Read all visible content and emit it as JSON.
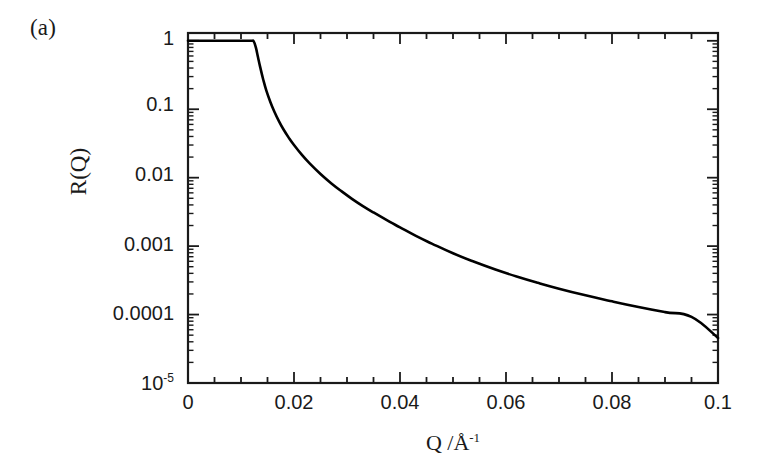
{
  "figure": {
    "panel_label": "(a)",
    "background_color": "#ffffff",
    "line_color": "#000000",
    "axis_color": "#1a1a1a"
  },
  "axes": {
    "y_title": "R(Q)",
    "x_title_main": "Q /",
    "x_title_unit": "Å",
    "x_title_exp": "-1",
    "x_title_full": "Q /Å-1"
  },
  "ticks": {
    "y_labels": [
      "1",
      "0.1",
      "0.01",
      "0.001",
      "0.0001",
      "10"
    ],
    "y_last_exponent": "-5",
    "x_labels": [
      "0",
      "0.02",
      "0.04",
      "0.06",
      "0.08",
      "0.1"
    ]
  },
  "chart_data": {
    "type": "line",
    "title": "",
    "subtitle": "",
    "xlabel": "Q /Å⁻¹",
    "ylabel": "R(Q)",
    "panel": "(a)",
    "xscale": "linear",
    "yscale": "log",
    "xlim": [
      0,
      0.1
    ],
    "ylim": [
      1e-05,
      1.3
    ],
    "grid": false,
    "legend": null,
    "x_major_ticks": [
      0,
      0.02,
      0.04,
      0.06,
      0.08,
      0.1
    ],
    "x_minor_tick_step": 0.005,
    "y_major_ticks": [
      1,
      0.1,
      0.01,
      0.001,
      0.0001,
      1e-05
    ],
    "y_tick_labels": [
      "1",
      "0.1",
      "0.01",
      "0.001",
      "0.0001",
      "10^-5"
    ],
    "critical_edge_Q": 0.0124,
    "annotations": [],
    "series": [
      {
        "name": "R(Q)",
        "color": "#000000",
        "linewidth": 2.6,
        "x": [
          0.0,
          0.001,
          0.002,
          0.003,
          0.004,
          0.005,
          0.006,
          0.007,
          0.008,
          0.009,
          0.01,
          0.011,
          0.012,
          0.0124,
          0.0128,
          0.0132,
          0.0136,
          0.0142,
          0.0148,
          0.0155,
          0.0163,
          0.0172,
          0.018,
          0.019,
          0.02,
          0.0215,
          0.023,
          0.025,
          0.027,
          0.029,
          0.031,
          0.033,
          0.035,
          0.038,
          0.04,
          0.043,
          0.046,
          0.05,
          0.054,
          0.058,
          0.062,
          0.066,
          0.07,
          0.075,
          0.08,
          0.085,
          0.09,
          0.095,
          0.1
        ],
        "y": [
          1.0,
          1.0,
          1.0,
          1.0,
          1.0,
          1.0,
          1.0,
          1.0,
          1.0,
          1.0,
          1.0,
          1.0,
          1.0,
          0.98,
          0.8,
          0.58,
          0.42,
          0.27,
          0.185,
          0.13,
          0.092,
          0.066,
          0.051,
          0.0385,
          0.03,
          0.0215,
          0.016,
          0.0113,
          0.0083,
          0.0063,
          0.00487,
          0.00385,
          0.0031,
          0.00228,
          0.00188,
          0.00141,
          0.00109,
          0.000785,
          0.00059,
          0.000455,
          0.00036,
          0.000291,
          0.000239,
          0.000191,
          0.000156,
          0.000129,
          0.0001085,
          9.25e-05,
          4.55e-05
        ]
      }
    ]
  }
}
